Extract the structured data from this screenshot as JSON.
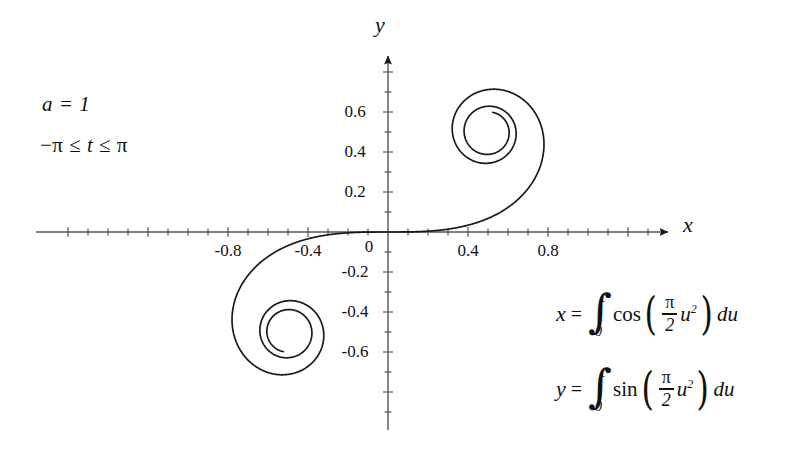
{
  "figure": {
    "background_color": "#ffffff",
    "curve_color": "#1a1a1a",
    "axis_color": "#4d4d4d"
  },
  "annotations": {
    "parameter_a": "a = 1",
    "t_range_prefix": "−π ≤ ",
    "t_range_var": "t",
    "t_range_suffix": " ≤ π"
  },
  "axes": {
    "x_label": "x",
    "y_label": "y",
    "origin_label": "0",
    "x_ticks": [
      {
        "value": -0.8,
        "label": "-0.8"
      },
      {
        "value": -0.4,
        "label": "-0.4"
      },
      {
        "value": 0.4,
        "label": "0.4"
      },
      {
        "value": 0.8,
        "label": "0.8"
      }
    ],
    "y_ticks": [
      {
        "value": 0.6,
        "label": "0.6"
      },
      {
        "value": 0.4,
        "label": "0.4"
      },
      {
        "value": 0.2,
        "label": "0.2"
      },
      {
        "value": -0.2,
        "label": "-0.2"
      },
      {
        "value": -0.4,
        "label": "-0.4"
      },
      {
        "value": -0.6,
        "label": "-0.6"
      }
    ],
    "minor_tick_step": 0.1
  },
  "equations": {
    "x": {
      "lhs": "x",
      "equals": "=",
      "integral": "∫",
      "upper_limit": "t",
      "lower_limit": "0",
      "function": "cos",
      "open_paren": "(",
      "frac_numerator": "π",
      "frac_denominator": "2",
      "argument": "u",
      "exponent": "2",
      "close_paren": ")",
      "differential": "du"
    },
    "y": {
      "lhs": "y",
      "equals": "=",
      "integral": "∫",
      "upper_limit": "t",
      "lower_limit": "0",
      "function": "sin",
      "open_paren": "(",
      "frac_numerator": "π",
      "frac_denominator": "2",
      "argument": "u",
      "exponent": "2",
      "close_paren": ")",
      "differential": "du"
    }
  },
  "chart_data": {
    "type": "line",
    "xlabel": "x",
    "ylabel": "y",
    "xlim": [
      -1.0,
      1.0
    ],
    "ylim": [
      -0.75,
      0.85
    ],
    "grid": false,
    "legend": null,
    "parametric": {
      "parameter": "t",
      "t_min": -3.14159,
      "t_max": 3.14159,
      "x_formula": "integral from 0 to t of cos((pi/2) u^2) du",
      "y_formula": "integral from 0 to t of sin((pi/2) u^2) du",
      "constant_a": 1
    },
    "asymptotic_centers": [
      {
        "name": "upper-spiral-center",
        "x": 0.5,
        "y": 0.5
      },
      {
        "name": "lower-spiral-center",
        "x": -0.5,
        "y": -0.5
      }
    ],
    "sampled_points": [
      {
        "t": -3.14159,
        "x": -0.4745,
        "y": -0.5656
      },
      {
        "t": -2.8,
        "x": -0.4556,
        "y": -0.397
      },
      {
        "t": -2.4,
        "x": -0.555,
        "y": -0.6197
      },
      {
        "t": -2.0,
        "x": -0.4883,
        "y": -0.3434
      },
      {
        "t": -1.6,
        "x": -0.389,
        "y": -0.6389
      },
      {
        "t": -1.2,
        "x": -0.7154,
        "y": -0.6234
      },
      {
        "t": -0.8,
        "x": -0.7648,
        "y": -0.2493
      },
      {
        "t": -0.4,
        "x": -0.3969,
        "y": -0.0334
      },
      {
        "t": 0.0,
        "x": 0.0,
        "y": 0.0
      },
      {
        "t": 0.4,
        "x": 0.3969,
        "y": 0.0334
      },
      {
        "t": 0.8,
        "x": 0.7648,
        "y": 0.2493
      },
      {
        "t": 1.2,
        "x": 0.7154,
        "y": 0.6234
      },
      {
        "t": 1.6,
        "x": 0.389,
        "y": 0.6389
      },
      {
        "t": 2.0,
        "x": 0.4883,
        "y": 0.3434
      },
      {
        "t": 2.4,
        "x": 0.555,
        "y": 0.6197
      },
      {
        "t": 2.8,
        "x": 0.4556,
        "y": 0.397
      },
      {
        "t": 3.14159,
        "x": 0.4745,
        "y": 0.5656
      }
    ]
  }
}
